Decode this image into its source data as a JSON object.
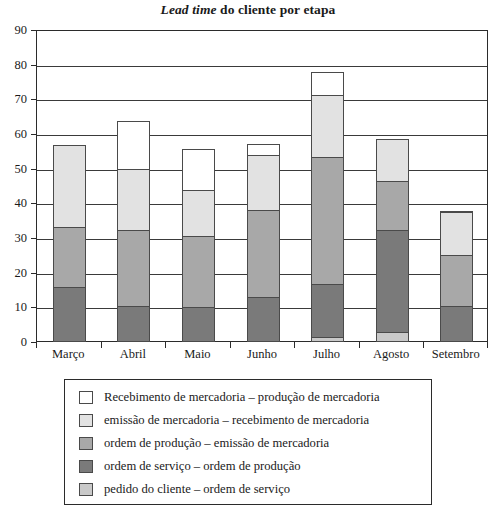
{
  "chart_data": {
    "type": "bar",
    "stacked": true,
    "title": "Lead time do cliente por etapa",
    "title_emphasis": "Lead time",
    "title_rest": " do cliente por etapa",
    "xlabel": "",
    "ylabel": "",
    "ylim": [
      0,
      90
    ],
    "ytick_step": 10,
    "yticks": [
      0,
      10,
      20,
      30,
      40,
      50,
      60,
      70,
      80,
      90
    ],
    "grid": true,
    "legend_position": "bottom",
    "categories": [
      "Março",
      "Abril",
      "Maio",
      "Junho",
      "Julho",
      "Agosto",
      "Setembro"
    ],
    "series": [
      {
        "name": "pedido do cliente – ordem de serviço",
        "color": "#c9c9c9",
        "values": [
          0,
          0,
          0,
          0,
          1.5,
          3,
          0
        ]
      },
      {
        "name": "ordem de serviço – ordem de produção",
        "color": "#7a7a7a",
        "values": [
          16,
          10.5,
          10,
          13,
          15.5,
          29.5,
          10.5
        ]
      },
      {
        "name": "ordem de produção – emissão de mercadoria",
        "color": "#a8a8a8",
        "values": [
          17.5,
          22,
          21,
          25.5,
          37,
          14.5,
          15
        ]
      },
      {
        "name": "emissão de mercadoria – recebimento de mercadoria",
        "color": "#e2e2e2",
        "values": [
          24,
          18,
          13.5,
          16,
          18,
          12.5,
          12.5
        ]
      },
      {
        "name": "Recebimento de mercadoria – produção de mercadoria",
        "color": "#ffffff",
        "values": [
          0,
          14,
          12,
          3.5,
          7,
          0,
          0.5
        ]
      }
    ],
    "totals": [
      57.5,
      64.5,
      56.5,
      58,
      79,
      59.5,
      38.5
    ]
  },
  "legend": {
    "items": [
      {
        "label": "Recebimento de mercadoria – produção de mercadoria",
        "color": "#ffffff"
      },
      {
        "label": "emissão de mercadoria – recebimento de mercadoria",
        "color": "#e2e2e2"
      },
      {
        "label": "ordem de produção – emissão de mercadoria",
        "color": "#a8a8a8"
      },
      {
        "label": "ordem de serviço – ordem de produção",
        "color": "#7a7a7a"
      },
      {
        "label": "pedido do cliente – ordem de serviço",
        "color": "#c9c9c9"
      }
    ]
  }
}
